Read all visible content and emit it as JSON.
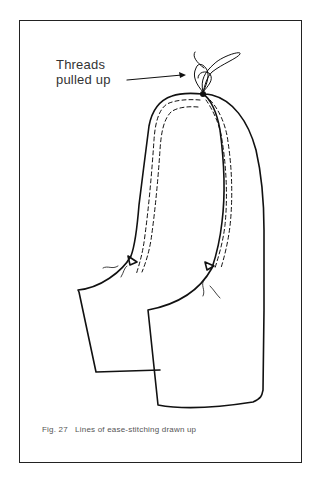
{
  "figure": {
    "label_line1": "Threads",
    "label_line2": "pulled up",
    "caption": "Fig. 27   Lines of ease-stitching drawn up",
    "stroke_color": "#111111"
  }
}
